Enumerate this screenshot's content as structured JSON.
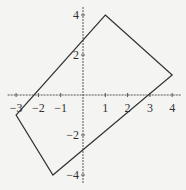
{
  "chart_data": {
    "type": "line",
    "title": "",
    "xlabel": "",
    "ylabel": "",
    "xlim": [
      -3.2,
      4.2
    ],
    "ylim": [
      -4.2,
      4.2
    ],
    "grid": false,
    "legend": null,
    "x_ticks": [
      -3,
      -2,
      -1,
      1,
      2,
      3,
      4
    ],
    "x_tick_labels": [
      "−3",
      "−2",
      "−1",
      "1",
      "2",
      "3",
      "4"
    ],
    "y_ticks": [
      4,
      2,
      -2,
      -4
    ],
    "y_tick_labels": [
      "4",
      "2",
      "−2",
      "−4"
    ],
    "series": [
      {
        "name": "quadrilateral",
        "closed": true,
        "points": [
          [
            1,
            4
          ],
          [
            4,
            1
          ],
          [
            -1.35,
            -4
          ],
          [
            -3,
            -1
          ]
        ],
        "color": "#333333"
      }
    ]
  },
  "style": {
    "background": "#f4f4f2",
    "axis_color": "#555555",
    "line_color": "#333333"
  }
}
